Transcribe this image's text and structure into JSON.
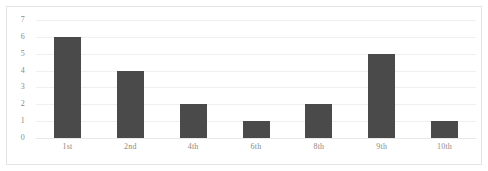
{
  "chart_data": {
    "type": "bar",
    "title": "",
    "subtitle": "",
    "xlabel": "",
    "ylabel": "",
    "categories": [
      "1st",
      "2nd",
      "4th",
      "6th",
      "8th",
      "9th",
      "10th"
    ],
    "values": [
      6,
      4,
      2,
      1,
      2,
      5,
      1
    ],
    "ylim": [
      0,
      7
    ],
    "y_ticks": [
      7,
      6,
      5,
      4,
      3,
      2,
      1,
      0
    ],
    "y_tick_step": 1,
    "grid": true,
    "grid_axis": "y",
    "legend": false,
    "legend_position": "none",
    "annotations": [],
    "colors": {
      "bar": "#4a4a4a",
      "gridline": "#efefef",
      "baseline": "#e8e8e8",
      "border": "#e3e3e3",
      "background": "#ffffff",
      "tick_label": "#8a8a8a"
    }
  }
}
